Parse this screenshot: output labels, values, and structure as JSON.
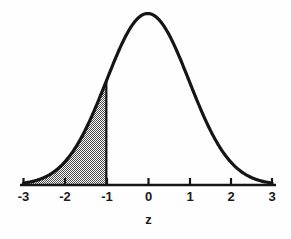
{
  "figure": {
    "title": "",
    "axis_title": "z",
    "curve_color": "#151515",
    "shade_color": "#8c8c8c",
    "background_color": "#fefefe",
    "axis_color": "#151515"
  },
  "chart_data": {
    "type": "line",
    "title": "",
    "subtitle": "",
    "xlabel": "z",
    "ylabel": "",
    "grid": false,
    "legend": null,
    "xlim": [
      -3,
      3
    ],
    "ylim": [
      0,
      0.4
    ],
    "tick_labels": [
      "-3",
      "-2",
      "-1",
      "0",
      "1",
      "2",
      "3"
    ],
    "ticks": [
      -3,
      -2,
      -1,
      0,
      1,
      2,
      3
    ],
    "series": [
      {
        "name": "standard normal pdf",
        "x": [
          -3,
          -2.8,
          -2.6,
          -2.4,
          -2.2,
          -2,
          -1.8,
          -1.6,
          -1.4,
          -1.2,
          -1,
          -0.8,
          -0.6,
          -0.4,
          -0.2,
          0,
          0.2,
          0.4,
          0.6,
          0.8,
          1,
          1.2,
          1.4,
          1.6,
          1.8,
          2,
          2.2,
          2.4,
          2.6,
          2.8,
          3
        ],
        "values": [
          0.0044,
          0.0079,
          0.0136,
          0.0224,
          0.0355,
          0.054,
          0.079,
          0.1109,
          0.1497,
          0.1942,
          0.242,
          0.2897,
          0.3332,
          0.3683,
          0.391,
          0.3989,
          0.391,
          0.3683,
          0.3332,
          0.2897,
          0.242,
          0.1942,
          0.1497,
          0.1109,
          0.079,
          0.054,
          0.0355,
          0.0224,
          0.0136,
          0.0079,
          0.0044
        ]
      }
    ],
    "shaded_region": {
      "label": "left tail",
      "from": -3,
      "to": -1,
      "pattern": "stipple",
      "area": 0.1587,
      "boundary_line_at": -1
    },
    "annotations": []
  },
  "axis": {
    "labels": [
      {
        "text": "-3",
        "value": -3
      },
      {
        "text": "-2",
        "value": -2
      },
      {
        "text": "-1",
        "value": -1
      },
      {
        "text": "0",
        "value": 0
      },
      {
        "text": "1",
        "value": 1
      },
      {
        "text": "2",
        "value": 2
      },
      {
        "text": "3",
        "value": 3
      }
    ],
    "title": "z"
  }
}
